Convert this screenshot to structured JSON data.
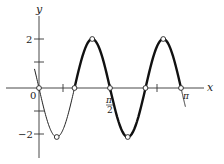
{
  "chart_data": {
    "type": "line",
    "title": "",
    "function": "y = -2 sin(4x)",
    "xlabel": "x",
    "ylabel": "y",
    "xlim": [
      -0.05,
      3.3
    ],
    "ylim": [
      -2.5,
      2.8
    ],
    "grid": false,
    "legend": null,
    "x_ticks": [
      {
        "value": 0.7854,
        "label": ""
      },
      {
        "value": 1.5708,
        "label": "π/2"
      },
      {
        "value": 2.3562,
        "label": ""
      },
      {
        "value": 3.1416,
        "label": "π"
      }
    ],
    "y_ticks": [
      {
        "value": 2,
        "label": "2"
      },
      {
        "value": 1,
        "label": ""
      },
      {
        "value": -1,
        "label": ""
      },
      {
        "value": -2,
        "label": "-2"
      }
    ],
    "origin_label": "0",
    "series": [
      {
        "name": "y = -2 sin(4x) (thin segment)",
        "style": "thin",
        "x_range": [
          -0.1,
          0.7854
        ]
      },
      {
        "name": "y = -2 sin(4x) (thick segment)",
        "style": "thick",
        "x_range": [
          0.7854,
          3.1416
        ]
      },
      {
        "name": "extension",
        "style": "thin",
        "x_range": [
          3.1416,
          3.24
        ]
      }
    ],
    "marked_points": [
      {
        "x": 0,
        "y": 0
      },
      {
        "x": 0.3927,
        "y": -2
      },
      {
        "x": 0.7854,
        "y": 0
      },
      {
        "x": 1.1781,
        "y": 2
      },
      {
        "x": 1.5708,
        "y": 0
      },
      {
        "x": 1.9635,
        "y": -2
      },
      {
        "x": 2.3562,
        "y": 0
      }
    ]
  },
  "labels": {
    "x_axis": "x",
    "y_axis": "y",
    "origin": "0",
    "y_tick_2": "2",
    "y_tick_neg2": "−2",
    "pi_over_2_num": "π",
    "pi_over_2_den": "2",
    "pi": "π"
  }
}
